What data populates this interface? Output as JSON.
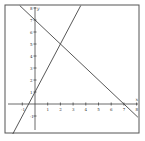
{
  "chart_data": {
    "type": "line",
    "title": "",
    "xlabel": "x",
    "ylabel": "y",
    "xlim": [
      -2,
      8.3
    ],
    "ylim": [
      -2.5,
      8.2
    ],
    "grid": false,
    "x_ticks": [
      "-1",
      "1",
      "2",
      "3",
      "4",
      "5",
      "6",
      "7",
      "8"
    ],
    "y_ticks": [
      "-1",
      "1",
      "2",
      "3",
      "4",
      "5",
      "6",
      "7",
      "8"
    ],
    "series": [
      {
        "name": "y = 7 - x",
        "x": [
          -1.2,
          8.1
        ],
        "y": [
          8.2,
          -1.1
        ]
      },
      {
        "name": "y = 2x + 1",
        "x": [
          -1.75,
          3.6
        ],
        "y": [
          -2.5,
          8.2
        ]
      }
    ],
    "intersection": {
      "x": 2,
      "y": 5
    }
  },
  "axes": {
    "x_label": "x",
    "y_label": "y"
  }
}
